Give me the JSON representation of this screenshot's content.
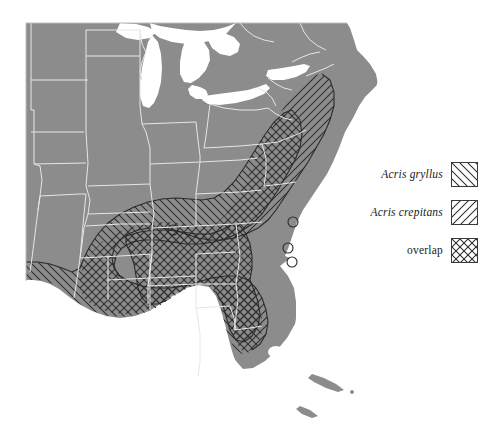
{
  "figure": {
    "type": "species-distribution-map",
    "region": "Eastern United States",
    "land_color": "#8c8c8c",
    "water_color": "#ffffff",
    "border_color": "#e8e8e8",
    "range_outline_color": "#2a2a2a",
    "hatch_color": "#2e2e2e"
  },
  "legend": {
    "items": [
      {
        "label": "Acris gryllus",
        "style": "species",
        "swatch": "hatch-backslash",
        "hatch_direction": "backslash"
      },
      {
        "label": "Acris crepitans",
        "style": "species",
        "swatch": "hatch-forwardslash",
        "hatch_direction": "forwardslash"
      },
      {
        "label": "overlap",
        "style": "plain",
        "swatch": "hatch-crosshatch",
        "hatch_direction": "crosshatch"
      }
    ]
  },
  "map_features": {
    "water_bodies": [
      "Lake Superior",
      "Lake Michigan",
      "Lake Huron",
      "Lake Erie",
      "Lake Ontario",
      "Lake Okeechobee",
      "Atlantic Ocean",
      "Gulf of Mexico"
    ],
    "disjunct_population_markers": 4
  }
}
